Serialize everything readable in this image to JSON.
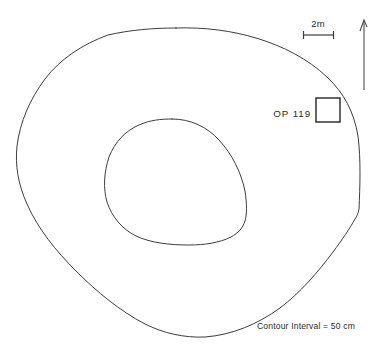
{
  "figure": {
    "type": "archaeological-site-plan",
    "background_color": "#ffffff",
    "line_color": "#3d3d3d",
    "text_color": "#2b2b2b"
  },
  "labels": {
    "operation": "OP 119",
    "scale_value": "2m",
    "caption": "Contour Interval = 50 cm"
  },
  "scalebar": {
    "label": "2m",
    "x_start": 303,
    "x_end": 334,
    "y": 35,
    "tick_height": 8
  },
  "north_arrow": {
    "name": "north-arrow",
    "x": 364,
    "y_top": 20,
    "y_bottom": 90
  },
  "excavation_unit": {
    "id": "OP 119",
    "x": 316,
    "y": 98,
    "width": 24,
    "height": 24
  },
  "contours": {
    "interval_label": "Contour Interval = 50 cm",
    "interval_value": "50 cm",
    "count": 2,
    "outer": {
      "name": "outer-contour",
      "bounds": {
        "x_min": 16,
        "x_max": 360,
        "y_min": 27,
        "y_max": 337
      },
      "path": "M 176 28 C 205 27 233 31 256 38 C 283 46 308 59 327 77 C 344 93 354 112 358 136 C 361 160 360 186 359 209 C 358 214 357 216 355 219 C 350 228 342 240 333 252 C 318 272 300 293 280 308 C 258 324 232 335 205 337 C 184 338 163 333 145 324 C 120 311 97 292 76 271 C 56 251 38 229 27 204 C 18 184 15 165 17 146 C 20 122 30 99 45 79 C 60 59 83 44 108 35 C 130 30 153 28 176 28 Z"
    },
    "inner": {
      "name": "inner-contour",
      "bounds": {
        "x_min": 105,
        "x_max": 247,
        "y_min": 118,
        "y_max": 245
      },
      "path": "M 172 119 C 191 119 207 127 219 140 C 232 154 241 172 245 191 C 247 204 247 214 245 221 C 243 228 238 233 231 237 C 219 243 204 245 189 245 C 170 245 151 243 136 236 C 122 229 112 217 107 202 C 103 188 104 172 109 157 C 115 142 125 131 139 125 C 150 120 161 119 172 119 Z"
    }
  }
}
